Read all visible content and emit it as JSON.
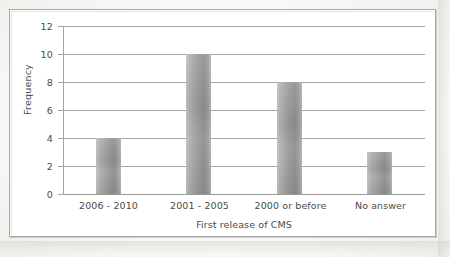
{
  "figure": {
    "frame_border_color": "#a8a8a4",
    "background_color": "#ffffff"
  },
  "chart_data": {
    "type": "bar",
    "title": "",
    "subtitle": "",
    "xlabel": "First release of CMS",
    "ylabel": "Frequency",
    "categories": [
      "2006 - 2010",
      "2001 - 2005",
      "2000 or before",
      "No answer"
    ],
    "values": [
      4,
      10,
      8,
      3
    ],
    "ylim": [
      0,
      12
    ],
    "y_ticks": [
      0,
      2,
      4,
      6,
      8,
      10,
      12
    ],
    "y_tick_labels": [
      "0",
      "2",
      "4",
      "6",
      "8",
      "10",
      "12"
    ],
    "grid": "horizontal",
    "legend": "none",
    "bar_color": "#9b9b9b",
    "bar_gradient": [
      "#c2c2c2",
      "#8e8e8e"
    ],
    "gridline_color": "#a5a5a2",
    "annotations": []
  },
  "axes": {
    "y_title": "Frequency",
    "x_title": "First release of CMS",
    "y_labels": [
      "12",
      "10",
      "8",
      "6",
      "4",
      "2",
      "0"
    ],
    "x_labels": [
      "2006 - 2010",
      "2001 - 2005",
      "2000 or before",
      "No answer"
    ]
  }
}
